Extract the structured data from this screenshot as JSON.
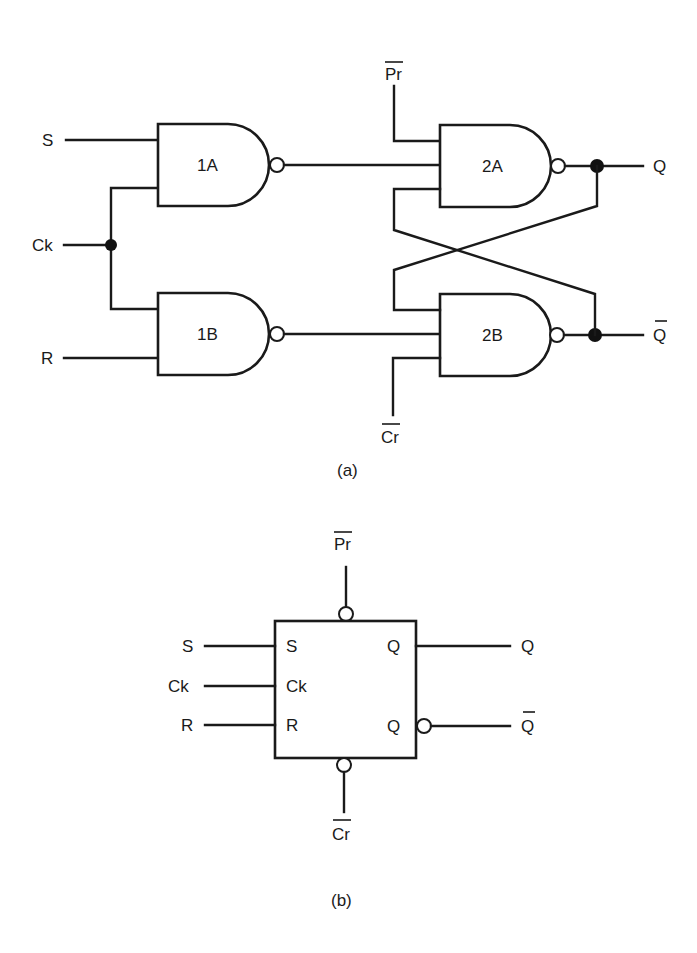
{
  "figure": {
    "part_a": {
      "caption": "(a)",
      "inputs": {
        "s": "S",
        "ck": "Ck",
        "r": "R",
        "pr": "Pr",
        "cr": "Cr"
      },
      "outputs": {
        "q": "Q",
        "qbar": "Q"
      },
      "gates": [
        {
          "id": "1A",
          "label": "1A",
          "type": "NAND"
        },
        {
          "id": "1B",
          "label": "1B",
          "type": "NAND"
        },
        {
          "id": "2A",
          "label": "2A",
          "type": "NAND"
        },
        {
          "id": "2B",
          "label": "2B",
          "type": "NAND"
        }
      ]
    },
    "part_b": {
      "caption": "(b)",
      "external_inputs": {
        "s": "S",
        "ck": "Ck",
        "r": "R",
        "pr": "Pr",
        "cr": "Cr"
      },
      "pin_labels": {
        "s": "S",
        "ck": "Ck",
        "r": "R",
        "q": "Q",
        "qbar": "Q"
      },
      "outputs": {
        "q": "Q",
        "qbar": "Q"
      }
    },
    "overbar_signals": [
      "Pr",
      "Cr",
      "Q (complement)"
    ]
  }
}
